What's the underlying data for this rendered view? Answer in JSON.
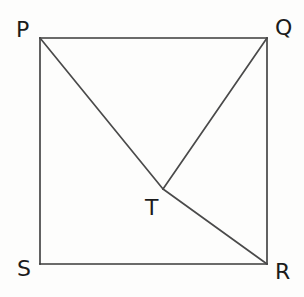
{
  "figure": {
    "background_color": "#fdfdfc",
    "line_color": "#3a3a3a",
    "label_color": "#1b1b1b",
    "labels": {
      "p": "P",
      "q": "Q",
      "r": "R",
      "s": "S",
      "t": "T"
    },
    "label_positions": {
      "p": {
        "left": 16,
        "top": 19
      },
      "q": {
        "left": 275,
        "top": 17
      },
      "r": {
        "left": 275,
        "top": 261
      },
      "s": {
        "left": 17,
        "top": 258
      },
      "t": {
        "left": 145,
        "top": 197
      }
    },
    "vertices": {
      "P": {
        "x": 40,
        "y": 38
      },
      "Q": {
        "x": 267,
        "y": 38
      },
      "R": {
        "x": 267,
        "y": 264
      },
      "S": {
        "x": 40,
        "y": 264
      },
      "T": {
        "x": 163,
        "y": 189
      }
    },
    "segments": [
      {
        "name": "PQ",
        "from": "P",
        "to": "Q"
      },
      {
        "name": "QR",
        "from": "Q",
        "to": "R"
      },
      {
        "name": "RS",
        "from": "R",
        "to": "S"
      },
      {
        "name": "SP",
        "from": "S",
        "to": "P"
      },
      {
        "name": "PT",
        "from": "P",
        "to": "T"
      },
      {
        "name": "TR",
        "from": "T",
        "to": "R"
      },
      {
        "name": "QT",
        "from": "Q",
        "to": "T"
      }
    ]
  }
}
